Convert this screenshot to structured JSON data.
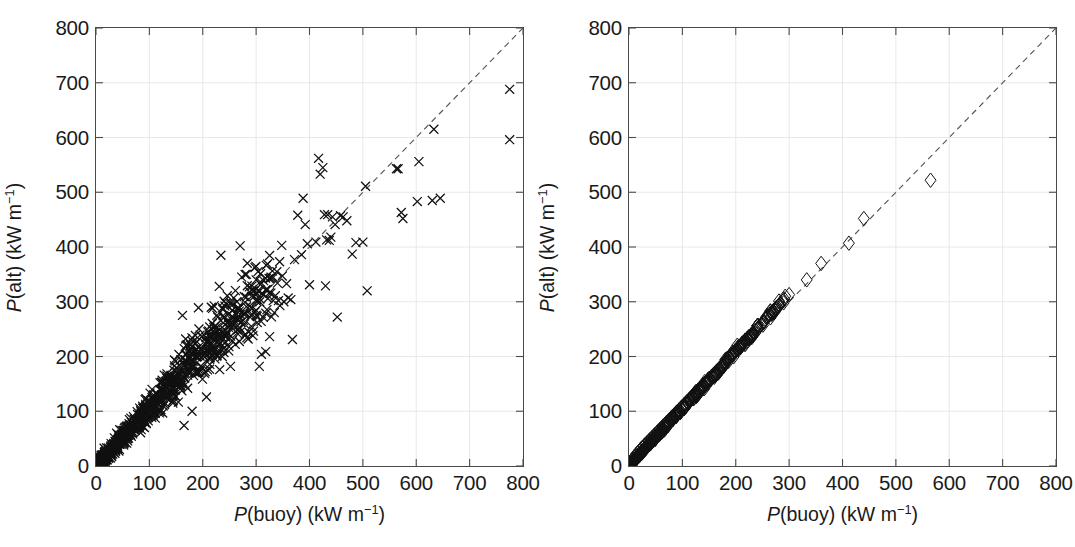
{
  "figure": {
    "background": "#ffffff",
    "marker_color": "#111111",
    "gridline_color": "#e8e8e8",
    "axis_color": "#4a4a4a",
    "refline_color": "#555555"
  },
  "panels": [
    {
      "id": "left",
      "xlabel_prefix": "P",
      "xlabel_mid": "(buoy) (kW m",
      "xlabel_sup": "−1",
      "xlabel_suffix": ")",
      "ylabel_prefix": "P",
      "ylabel_mid": "(alt) (kW m",
      "ylabel_sup": "−1",
      "ylabel_suffix": ")"
    },
    {
      "id": "right",
      "xlabel_prefix": "P",
      "xlabel_mid": "(buoy) (kW m",
      "xlabel_sup": "−1",
      "xlabel_suffix": ")",
      "ylabel_prefix": "P",
      "ylabel_mid": "(alt) (kW m",
      "ylabel_sup": "−1",
      "ylabel_suffix": ")"
    }
  ],
  "ticks": {
    "x": [
      "0",
      "100",
      "200",
      "300",
      "400",
      "500",
      "600",
      "700",
      "800"
    ],
    "y": [
      "0",
      "100",
      "200",
      "300",
      "400",
      "500",
      "600",
      "700",
      "800"
    ]
  },
  "chart_data": [
    {
      "type": "scatter",
      "panel": "left",
      "title": "",
      "xlabel": "P(buoy) (kW m−1)",
      "ylabel": "P(alt) (kW m−1)",
      "xlim": [
        0,
        800
      ],
      "ylim": [
        0,
        800
      ],
      "xticks": [
        0,
        100,
        200,
        300,
        400,
        500,
        600,
        700,
        800
      ],
      "yticks": [
        0,
        100,
        200,
        300,
        400,
        500,
        600,
        700,
        800
      ],
      "grid": true,
      "legend": "none",
      "marker": "x",
      "marker_size": 9,
      "reference_line": {
        "style": "dashed",
        "slope": 1,
        "intercept": 0,
        "label": "1:1 line"
      },
      "n_points_approx": 1100,
      "description": "Dense elongated cloud of x-markers along the 1:1 line, widening with magnitude; scattered outliers above and below up to ~780 kW m-1.",
      "points": [
        [
          775,
          688
        ],
        [
          775,
          596
        ],
        [
          645,
          489
        ],
        [
          633,
          615
        ],
        [
          630,
          485
        ],
        [
          605,
          556
        ],
        [
          602,
          483
        ],
        [
          575,
          452
        ],
        [
          572,
          463
        ],
        [
          566,
          543
        ],
        [
          563,
          543
        ],
        [
          508,
          320
        ],
        [
          505,
          511
        ],
        [
          500,
          409
        ],
        [
          487,
          408
        ],
        [
          480,
          387
        ],
        [
          470,
          448
        ],
        [
          463,
          455
        ],
        [
          458,
          457
        ],
        [
          452,
          272
        ],
        [
          448,
          441
        ],
        [
          443,
          455
        ],
        [
          440,
          418
        ],
        [
          437,
          412
        ],
        [
          434,
          459
        ],
        [
          432,
          413
        ],
        [
          430,
          329
        ],
        [
          428,
          459
        ],
        [
          425,
          545
        ],
        [
          420,
          533
        ],
        [
          417,
          562
        ],
        [
          412,
          409
        ],
        [
          400,
          331
        ],
        [
          396,
          406
        ],
        [
          392,
          441
        ],
        [
          388,
          489
        ],
        [
          385,
          386
        ],
        [
          378,
          458
        ],
        [
          372,
          377
        ],
        [
          368,
          231
        ],
        [
          365,
          304
        ],
        [
          360,
          307
        ],
        [
          357,
          333
        ],
        [
          352,
          300
        ],
        [
          348,
          403
        ],
        [
          344,
          373
        ],
        [
          340,
          334
        ],
        [
          336,
          311
        ],
        [
          332,
          302
        ],
        [
          328,
          345
        ],
        [
          322,
          306
        ],
        [
          318,
          209
        ],
        [
          314,
          313
        ],
        [
          310,
          204
        ],
        [
          306,
          182
        ],
        [
          302,
          262
        ],
        [
          300,
          340
        ],
        [
          297,
          320
        ],
        [
          294,
          238
        ],
        [
          291,
          255
        ],
        [
          288,
          292
        ],
        [
          285,
          232
        ],
        [
          282,
          350
        ],
        [
          279,
          299
        ],
        [
          276,
          266
        ],
        [
          273,
          345
        ],
        [
          270,
          402
        ],
        [
          267,
          287
        ],
        [
          264,
          300
        ],
        [
          261,
          222
        ],
        [
          258,
          307
        ],
        [
          255,
          284
        ],
        [
          252,
          182
        ],
        [
          249,
          218
        ],
        [
          246,
          311
        ],
        [
          243,
          297
        ],
        [
          240,
          301
        ],
        [
          237,
          289
        ],
        [
          234,
          385
        ],
        [
          231,
          328
        ],
        [
          228,
          272
        ],
        [
          225,
          213
        ],
        [
          222,
          244
        ],
        [
          219,
          214
        ],
        [
          216,
          290
        ],
        [
          213,
          254
        ],
        [
          210,
          229
        ],
        [
          207,
          126
        ],
        [
          204,
          206
        ],
        [
          201,
          211
        ],
        [
          198,
          180
        ],
        [
          195,
          239
        ],
        [
          192,
          289
        ],
        [
          189,
          227
        ],
        [
          186,
          200
        ],
        [
          183,
          165
        ],
        [
          180,
          100
        ],
        [
          177,
          221
        ],
        [
          174,
          196
        ],
        [
          171,
          188
        ],
        [
          168,
          232
        ],
        [
          165,
          74
        ],
        [
          162,
          275
        ],
        [
          159,
          194
        ],
        [
          156,
          152
        ],
        [
          153,
          171
        ],
        [
          150,
          150
        ],
        [
          147,
          183
        ],
        [
          144,
          140
        ],
        [
          141,
          164
        ],
        [
          138,
          131
        ],
        [
          135,
          158
        ],
        [
          132,
          124
        ],
        [
          129,
          145
        ],
        [
          126,
          139
        ],
        [
          123,
          118
        ],
        [
          120,
          152
        ],
        [
          117,
          102
        ],
        [
          114,
          131
        ],
        [
          111,
          96
        ],
        [
          108,
          124
        ],
        [
          105,
          140
        ],
        [
          102,
          108
        ],
        [
          99,
          118
        ],
        [
          96,
          92
        ],
        [
          93,
          110
        ],
        [
          90,
          104
        ],
        [
          87,
          88
        ],
        [
          84,
          99
        ],
        [
          81,
          84
        ],
        [
          78,
          94
        ],
        [
          75,
          78
        ],
        [
          72,
          86
        ],
        [
          69,
          72
        ],
        [
          66,
          80
        ],
        [
          63,
          66
        ],
        [
          60,
          71
        ],
        [
          57,
          60
        ],
        [
          54,
          64
        ],
        [
          51,
          54
        ],
        [
          48,
          57
        ],
        [
          45,
          48
        ],
        [
          42,
          50
        ],
        [
          39,
          42
        ],
        [
          36,
          44
        ],
        [
          33,
          36
        ],
        [
          30,
          37
        ],
        [
          27,
          29
        ],
        [
          24,
          30
        ],
        [
          21,
          23
        ],
        [
          18,
          22
        ],
        [
          15,
          17
        ],
        [
          12,
          14
        ],
        [
          9,
          11
        ],
        [
          6,
          7
        ],
        [
          3,
          4
        ]
      ]
    },
    {
      "type": "scatter",
      "panel": "right",
      "title": "",
      "xlabel": "P(buoy) (kW m−1)",
      "ylabel": "P(alt) (kW m−1)",
      "xlim": [
        0,
        800
      ],
      "ylim": [
        0,
        800
      ],
      "xticks": [
        0,
        100,
        200,
        300,
        400,
        500,
        600,
        700,
        800
      ],
      "yticks": [
        0,
        100,
        200,
        300,
        400,
        500,
        600,
        700,
        800
      ],
      "grid": true,
      "legend": "none",
      "marker": "diamond-open",
      "marker_size": 11,
      "reference_line": {
        "style": "dashed",
        "slope": 1,
        "intercept": 0,
        "label": "1:1 line"
      },
      "n_points_approx": 520,
      "description": "Tightly packed chain of open diamonds lying almost exactly on the 1:1 line; solid black below ~130 kW m-1 where markers overlap, becoming individually resolvable above ~200 kW m-1. Largest point near (565, 522).",
      "points": [
        [
          565,
          522
        ],
        [
          440,
          452
        ],
        [
          412,
          407
        ],
        [
          360,
          370
        ],
        [
          333,
          340
        ],
        [
          300,
          313
        ],
        [
          291,
          305
        ],
        [
          283,
          297
        ],
        [
          276,
          289
        ],
        [
          270,
          283
        ],
        [
          264,
          277
        ],
        [
          258,
          271
        ],
        [
          252,
          264
        ],
        [
          247,
          258
        ],
        [
          242,
          253
        ],
        [
          237,
          248
        ],
        [
          233,
          244
        ],
        [
          229,
          240
        ],
        [
          225,
          236
        ],
        [
          221,
          232
        ],
        [
          217,
          227
        ],
        [
          213,
          223
        ],
        [
          210,
          220
        ],
        [
          206,
          216
        ],
        [
          203,
          213
        ],
        [
          200,
          210
        ],
        [
          196,
          206
        ],
        [
          193,
          203
        ],
        [
          190,
          200
        ],
        [
          187,
          196
        ],
        [
          184,
          193
        ],
        [
          181,
          190
        ],
        [
          178,
          187
        ],
        [
          175,
          184
        ],
        [
          172,
          181
        ],
        [
          169,
          178
        ],
        [
          166,
          175
        ],
        [
          163,
          172
        ],
        [
          160,
          169
        ],
        [
          157,
          166
        ],
        [
          154,
          163
        ],
        [
          151,
          160
        ],
        [
          148,
          157
        ],
        [
          145,
          154
        ],
        [
          142,
          151
        ],
        [
          139,
          148
        ],
        [
          136,
          145
        ],
        [
          133,
          142
        ],
        [
          130,
          139
        ],
        [
          127,
          136
        ],
        [
          124,
          133
        ],
        [
          121,
          130
        ],
        [
          118,
          127
        ],
        [
          115,
          124
        ],
        [
          112,
          121
        ],
        [
          109,
          118
        ],
        [
          106,
          115
        ],
        [
          103,
          112
        ],
        [
          100,
          109
        ],
        [
          97,
          106
        ],
        [
          94,
          103
        ],
        [
          91,
          100
        ],
        [
          88,
          97
        ],
        [
          85,
          94
        ],
        [
          82,
          91
        ],
        [
          79,
          88
        ],
        [
          76,
          85
        ],
        [
          73,
          82
        ],
        [
          70,
          79
        ],
        [
          67,
          76
        ],
        [
          64,
          73
        ],
        [
          61,
          70
        ],
        [
          58,
          67
        ],
        [
          55,
          64
        ],
        [
          52,
          61
        ],
        [
          49,
          58
        ],
        [
          46,
          55
        ],
        [
          43,
          52
        ],
        [
          40,
          49
        ],
        [
          37,
          46
        ],
        [
          34,
          43
        ],
        [
          31,
          40
        ],
        [
          28,
          37
        ],
        [
          25,
          34
        ],
        [
          22,
          31
        ],
        [
          19,
          27
        ],
        [
          16,
          24
        ],
        [
          13,
          21
        ],
        [
          10,
          17
        ],
        [
          7,
          13
        ],
        [
          4,
          9
        ],
        [
          2,
          5
        ]
      ]
    }
  ]
}
